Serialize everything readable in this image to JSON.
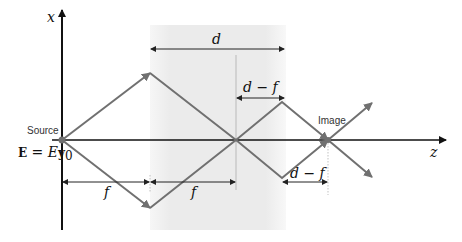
{
  "diagram": {
    "axes": {
      "x_label": "x",
      "z_label": "z"
    },
    "labels": {
      "source": "Source",
      "image": "Image",
      "field_eq_E": "E",
      "field_eq_mid": " = E",
      "field_eq_y": "y",
      "field_eq_sub": "0"
    },
    "dimensions": {
      "d": "d",
      "d_minus_f_top": "d − f",
      "d_minus_f_bottom": "d − f",
      "f_left": "f",
      "f_right": "f"
    },
    "colors": {
      "ray": "#707070",
      "axis": "#111111",
      "shade": "#ececec"
    }
  }
}
